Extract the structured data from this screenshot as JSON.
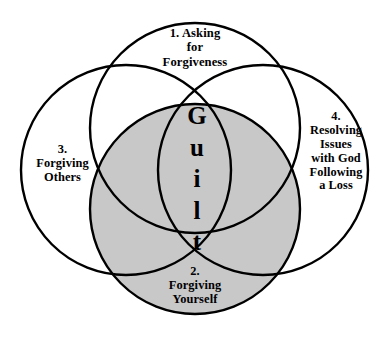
{
  "diagram": {
    "type": "venn",
    "background_color": "#ffffff",
    "stroke_color": "#000000",
    "shaded_fill_color": "#c8c8c8",
    "center_word": "Guilt",
    "center_letters": [
      "G",
      "u",
      "i",
      "l",
      "t"
    ],
    "circles": [
      {
        "id": 1,
        "number": "1.",
        "position": "top",
        "shaded": false,
        "lines": [
          "1. Asking",
          "for",
          "Forgiveness"
        ],
        "label": "1. Asking for Forgiveness"
      },
      {
        "id": 2,
        "number": "2.",
        "position": "bottom",
        "shaded": true,
        "lines": [
          "2.",
          "Forgiving",
          "Yourself"
        ],
        "label": "2. Forgiving Yourself"
      },
      {
        "id": 3,
        "number": "3.",
        "position": "left",
        "shaded": false,
        "lines": [
          "3.",
          "Forgiving",
          "Others"
        ],
        "label": "3. Forgiving Others"
      },
      {
        "id": 4,
        "number": "4.",
        "position": "right",
        "shaded": false,
        "lines": [
          "4.",
          "Resolving",
          "Issues",
          "with God",
          "Following",
          "a Loss"
        ],
        "label": "4. Resolving Issues with God Following a Loss"
      }
    ]
  }
}
